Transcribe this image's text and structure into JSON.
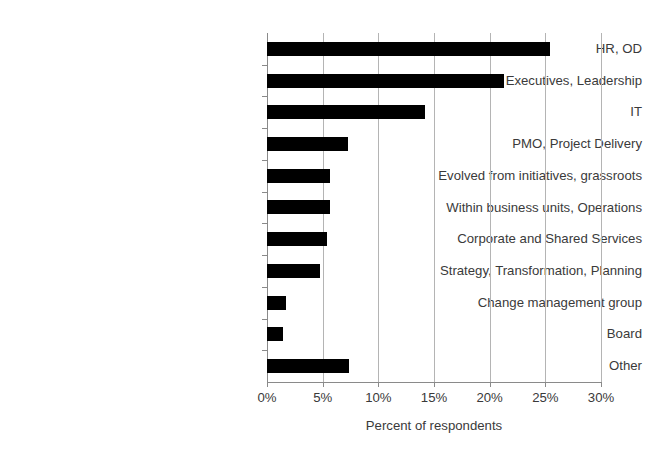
{
  "chart_data": {
    "type": "bar",
    "orientation": "horizontal",
    "title": "",
    "xlabel": "Percent of respondents",
    "ylabel": "",
    "xlim": [
      0,
      30
    ],
    "xticks": [
      0,
      5,
      10,
      15,
      20,
      25,
      30
    ],
    "xtick_labels": [
      "0%",
      "5%",
      "10%",
      "15%",
      "20%",
      "25%",
      "30%"
    ],
    "grid": true,
    "grid_axis": "x",
    "legend": false,
    "bar_color": "#000000",
    "gridline_color": "#b4b4b4",
    "axis_color": "#8a8a8a",
    "categories": [
      "HR, OD",
      "Executives, Leadership",
      "IT",
      "PMO, Project Delivery",
      "Evolved from initiatives, grassroots",
      "Within business units, Operations",
      "Corporate and Shared Services",
      "Strategy, Transformation, Planning",
      "Change management group",
      "Board",
      "Other"
    ],
    "values": [
      25.4,
      21.3,
      14.2,
      7.3,
      5.7,
      5.7,
      5.4,
      4.8,
      1.7,
      1.4,
      7.4
    ],
    "value_unit": "%"
  }
}
